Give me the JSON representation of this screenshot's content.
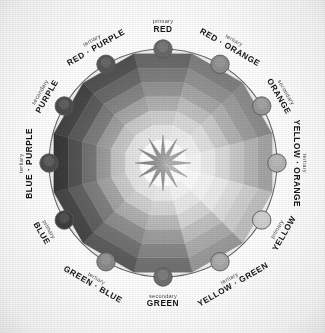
{
  "diagram": {
    "type": "color-wheel",
    "rendering": "grayscale",
    "hue_count": 12,
    "ring_count": 6,
    "center_star_points": 12,
    "colors": {
      "background": "#ffffff",
      "outline": "#6e6e6e",
      "label_text": "#141414",
      "sub_text": "#4b4b4b"
    }
  },
  "hues": [
    {
      "id": "red",
      "name": "RED",
      "role": "primary",
      "angle": 0,
      "dot": "#6a6a6a",
      "rings": [
        "#6e6e6e",
        "#7e7e7e",
        "#909090",
        "#a6a6a6",
        "#c2c2c2",
        "#dcdcdc"
      ],
      "star": "#4a4a4a",
      "label_side": "top"
    },
    {
      "id": "red-orange",
      "name": "RED · ORANGE",
      "role": "tertiary",
      "angle": 30,
      "dot": "#8e8e8e",
      "rings": [
        "#868686",
        "#949494",
        "#a4a4a4",
        "#b8b8b8",
        "#cfcfcf",
        "#e4e4e4"
      ],
      "star": "#565656",
      "label_side": "top"
    },
    {
      "id": "orange",
      "name": "ORANGE",
      "role": "secondary",
      "angle": 60,
      "dot": "#9a9a9a",
      "rings": [
        "#939393",
        "#a0a0a0",
        "#b0b0b0",
        "#c4c4c4",
        "#d8d8d8",
        "#ebebeb"
      ],
      "star": "#5f5f5f",
      "label_side": "right"
    },
    {
      "id": "yellow-orange",
      "name": "YELLOW · ORANGE",
      "role": "tertiary",
      "angle": 90,
      "dot": "#b4b4b4",
      "rings": [
        "#adadad",
        "#bababa",
        "#c8c8c8",
        "#d6d6d6",
        "#e6e6e6",
        "#f2f2f2"
      ],
      "star": "#6d6d6d",
      "label_side": "right"
    },
    {
      "id": "yellow",
      "name": "YELLOW",
      "role": "primary",
      "angle": 120,
      "dot": "#cfcfcf",
      "rings": [
        "#cacaca",
        "#d6d6d6",
        "#e0e0e0",
        "#eaeaea",
        "#f2f2f2",
        "#fafafa"
      ],
      "star": "#818181",
      "label_side": "right"
    },
    {
      "id": "yellow-green",
      "name": "YELLOW · GREEN",
      "role": "tertiary",
      "angle": 150,
      "dot": "#a8a8a8",
      "rings": [
        "#a2a2a2",
        "#b0b0b0",
        "#c0c0c0",
        "#d2d2d2",
        "#e3e3e3",
        "#f0f0f0"
      ],
      "star": "#676767",
      "label_side": "bottom"
    },
    {
      "id": "green",
      "name": "GREEN",
      "role": "secondary",
      "angle": 180,
      "dot": "#707070",
      "rings": [
        "#777777",
        "#878787",
        "#9a9a9a",
        "#b2b2b2",
        "#cbcbcb",
        "#e2e2e2"
      ],
      "star": "#4c4c4c",
      "label_side": "bottom"
    },
    {
      "id": "green-blue",
      "name": "GREEN · BLUE",
      "role": "tertiary",
      "angle": 210,
      "dot": "#8b8b8b",
      "rings": [
        "#606060",
        "#727272",
        "#898989",
        "#a4a4a4",
        "#c2c2c2",
        "#dcdcdc"
      ],
      "star": "#3f3f3f",
      "label_side": "bottom"
    },
    {
      "id": "blue",
      "name": "BLUE",
      "role": "primary",
      "angle": 240,
      "dot": "#3f3f3f",
      "rings": [
        "#4a4a4a",
        "#5e5e5e",
        "#787878",
        "#989898",
        "#bbbbbb",
        "#d9d9d9"
      ],
      "star": "#343434",
      "label_side": "left"
    },
    {
      "id": "blue-purple",
      "name": "BLUE · PURPLE",
      "role": "tertiary",
      "angle": 270,
      "dot": "#4e4e4e",
      "rings": [
        "#3a3a3a",
        "#505050",
        "#6c6c6c",
        "#8e8e8e",
        "#b4b4b4",
        "#d6d6d6"
      ],
      "star": "#2e2e2e",
      "label_side": "left"
    },
    {
      "id": "purple",
      "name": "PURPLE",
      "role": "secondary",
      "angle": 300,
      "dot": "#4d4d4d",
      "rings": [
        "#464646",
        "#5a5a5a",
        "#747474",
        "#939393",
        "#b6b6b6",
        "#d8d8d8"
      ],
      "star": "#333333",
      "label_side": "left"
    },
    {
      "id": "red-purple",
      "name": "RED · PURPLE",
      "role": "tertiary",
      "angle": 330,
      "dot": "#575757",
      "rings": [
        "#555555",
        "#686868",
        "#7f7f7f",
        "#9c9c9c",
        "#bdbdbd",
        "#dbdbdb"
      ],
      "star": "#3a3a3a",
      "label_side": "top"
    }
  ]
}
